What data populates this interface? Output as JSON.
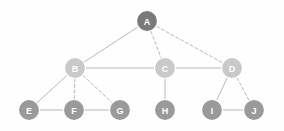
{
  "diagram": {
    "canvas": {
      "width": 284,
      "height": 131,
      "background": "#fefefe"
    },
    "style": {
      "node_radius": 10.5,
      "node_stroke": "#ffffff",
      "node_stroke_width": 1.2,
      "edge_color": "#b8b8b8",
      "edge_width": 1,
      "dash_pattern": "3,2.5",
      "label_color": "#ffffff",
      "label_font_size": 9,
      "color_level_1": "#7a7a7a",
      "color_level_2": "#c9c9c9",
      "color_level_3": "#9a9a9a"
    },
    "nodes": [
      {
        "id": "A",
        "label": "A",
        "x": 147,
        "y": 21,
        "r": 10.5,
        "fill": "#7a7a7a",
        "level": 1
      },
      {
        "id": "B",
        "label": "B",
        "x": 75,
        "y": 68,
        "r": 10.5,
        "fill": "#c9c9c9",
        "level": 2
      },
      {
        "id": "C",
        "label": "C",
        "x": 165,
        "y": 68,
        "r": 10.5,
        "fill": "#c9c9c9",
        "level": 2
      },
      {
        "id": "D",
        "label": "D",
        "x": 232,
        "y": 68,
        "r": 10.5,
        "fill": "#c9c9c9",
        "level": 2
      },
      {
        "id": "E",
        "label": "E",
        "x": 29,
        "y": 110,
        "r": 10.5,
        "fill": "#9a9a9a",
        "level": 3
      },
      {
        "id": "F",
        "label": "F",
        "x": 74,
        "y": 110,
        "r": 10.5,
        "fill": "#9a9a9a",
        "level": 3
      },
      {
        "id": "G",
        "label": "G",
        "x": 120,
        "y": 110,
        "r": 10.5,
        "fill": "#9a9a9a",
        "level": 3
      },
      {
        "id": "H",
        "label": "H",
        "x": 165,
        "y": 110,
        "r": 10.5,
        "fill": "#9a9a9a",
        "level": 3
      },
      {
        "id": "I",
        "label": "I",
        "x": 212,
        "y": 110,
        "r": 10.5,
        "fill": "#9a9a9a",
        "level": 3
      },
      {
        "id": "J",
        "label": "J",
        "x": 254,
        "y": 110,
        "r": 10.5,
        "fill": "#9a9a9a",
        "level": 3
      }
    ],
    "edges": [
      {
        "from": "A",
        "to": "B",
        "style": "solid"
      },
      {
        "from": "A",
        "to": "C",
        "style": "dashed"
      },
      {
        "from": "A",
        "to": "D",
        "style": "dashed"
      },
      {
        "from": "B",
        "to": "C",
        "style": "solid"
      },
      {
        "from": "C",
        "to": "D",
        "style": "solid"
      },
      {
        "from": "B",
        "to": "E",
        "style": "solid"
      },
      {
        "from": "B",
        "to": "F",
        "style": "dashed"
      },
      {
        "from": "B",
        "to": "G",
        "style": "dashed"
      },
      {
        "from": "E",
        "to": "F",
        "style": "solid"
      },
      {
        "from": "F",
        "to": "G",
        "style": "solid"
      },
      {
        "from": "C",
        "to": "H",
        "style": "solid"
      },
      {
        "from": "D",
        "to": "I",
        "style": "solid"
      },
      {
        "from": "D",
        "to": "J",
        "style": "dashed"
      },
      {
        "from": "I",
        "to": "J",
        "style": "solid"
      }
    ]
  }
}
